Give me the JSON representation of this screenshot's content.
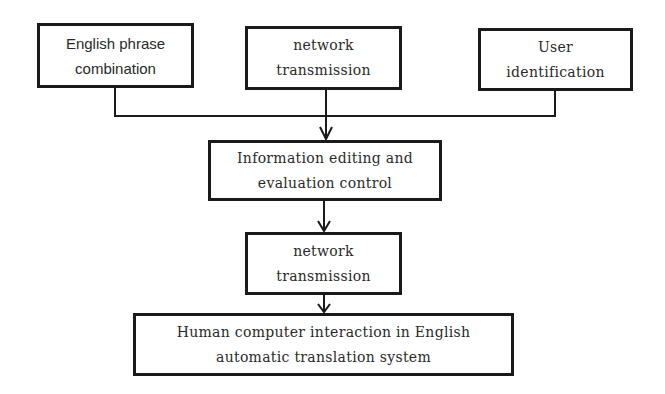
{
  "diagram": {
    "type": "flowchart",
    "nodes": [
      {
        "id": "english_phrase",
        "lines": [
          "English phrase",
          "combination"
        ]
      },
      {
        "id": "network_top",
        "lines": [
          "network",
          "transmission"
        ]
      },
      {
        "id": "user_id",
        "lines": [
          "User",
          "identification"
        ]
      },
      {
        "id": "info_edit",
        "lines": [
          "Information editing and",
          "evaluation control"
        ]
      },
      {
        "id": "network_mid",
        "lines": [
          "network",
          "transmission"
        ]
      },
      {
        "id": "hci",
        "lines": [
          "Human computer interaction in English",
          "automatic translation system"
        ]
      }
    ],
    "edges": [
      {
        "from": "english_phrase",
        "to": "info_edit"
      },
      {
        "from": "network_top",
        "to": "info_edit"
      },
      {
        "from": "user_id",
        "to": "info_edit"
      },
      {
        "from": "info_edit",
        "to": "network_mid"
      },
      {
        "from": "network_mid",
        "to": "hci"
      }
    ],
    "colors": {
      "stroke": "#1a1a1a",
      "text": "#2a2a2a",
      "background": "#ffffff"
    }
  }
}
